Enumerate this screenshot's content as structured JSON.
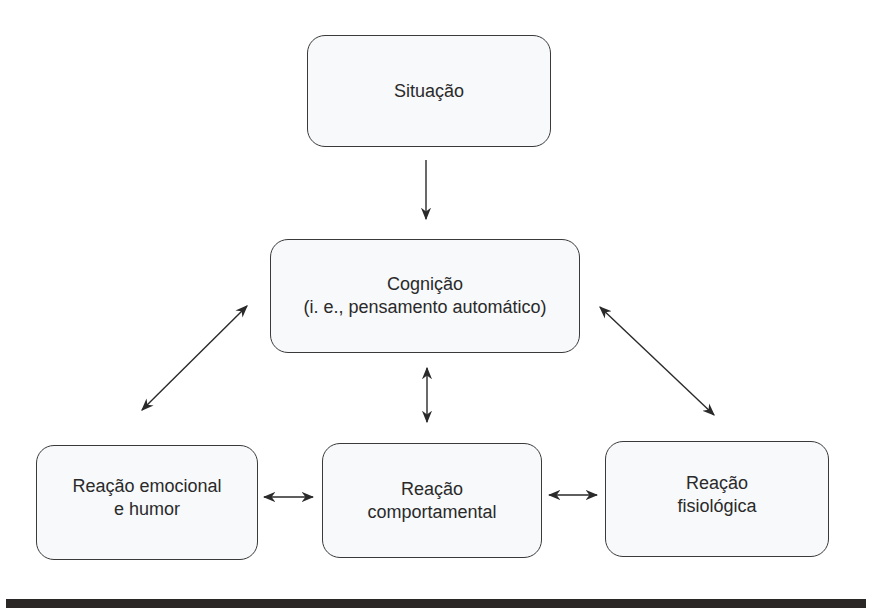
{
  "diagram": {
    "nodes": [
      {
        "id": "situacao",
        "lines": [
          "Situação"
        ]
      },
      {
        "id": "cognicao",
        "lines": [
          "Cognição",
          "(i. e., pensamento automático)"
        ]
      },
      {
        "id": "reacao_emocional",
        "lines": [
          "Reação emocional",
          "e humor"
        ]
      },
      {
        "id": "reacao_comportamental",
        "lines": [
          "Reação",
          "comportamental"
        ]
      },
      {
        "id": "reacao_fisiologica",
        "lines": [
          "Reação",
          "fisiológica"
        ]
      }
    ],
    "edges": [
      {
        "from": "situacao",
        "to": "cognicao",
        "type": "one-way"
      },
      {
        "from": "cognicao",
        "to": "reacao_emocional",
        "type": "two-way"
      },
      {
        "from": "cognicao",
        "to": "reacao_comportamental",
        "type": "two-way"
      },
      {
        "from": "cognicao",
        "to": "reacao_fisiologica",
        "type": "two-way"
      },
      {
        "from": "reacao_emocional",
        "to": "reacao_comportamental",
        "type": "two-way"
      },
      {
        "from": "reacao_comportamental",
        "to": "reacao_fisiologica",
        "type": "two-way"
      }
    ],
    "colors": {
      "border": "#3a3a3a",
      "fill": "#f7f9fb",
      "text": "#2a2a2a",
      "footer": "#2b2726"
    }
  }
}
